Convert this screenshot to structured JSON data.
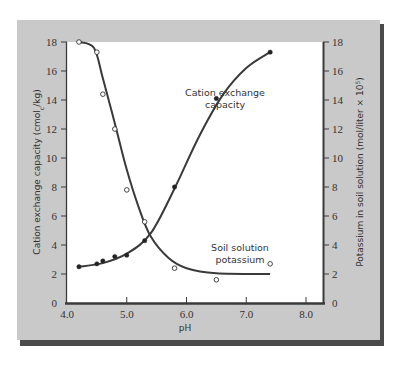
{
  "chart_data": {
    "type": "line",
    "title": "",
    "xlabel": "pH",
    "ylabel": "Cation exchange capacity (cmolc/kg)",
    "ylabel_right": "Potassium in soil solution (mol/liter × 10^5)",
    "xlim": [
      4.0,
      8.0
    ],
    "ylim": [
      0,
      18
    ],
    "ylim_right": [
      0,
      18
    ],
    "x_ticks": [
      "4.0",
      "5.0",
      "6.0",
      "7.0",
      "8.0"
    ],
    "y_ticks": [
      "0",
      "2",
      "4",
      "6",
      "8",
      "10",
      "12",
      "14",
      "16",
      "18"
    ],
    "y_ticks_right": [
      "0",
      "2",
      "4",
      "6",
      "8",
      "10",
      "12",
      "14",
      "16",
      "18"
    ],
    "grid": false,
    "legend": "none (curves labeled inline)",
    "series": [
      {
        "name": "Cation exchange capacity",
        "marker": "filled-circle",
        "axis": "left",
        "x": [
          4.2,
          4.5,
          4.6,
          4.8,
          5.0,
          5.3,
          5.8,
          6.5,
          7.4
        ],
        "y": [
          2.5,
          2.7,
          2.9,
          3.2,
          3.3,
          4.3,
          8.0,
          14.1,
          17.3
        ]
      },
      {
        "name": "Soil solution potassium",
        "marker": "open-circle",
        "axis": "right",
        "x": [
          4.2,
          4.5,
          4.6,
          4.8,
          5.0,
          5.3,
          5.8,
          6.5,
          7.4
        ],
        "y": [
          18.0,
          17.3,
          14.4,
          12.0,
          7.8,
          5.6,
          2.4,
          1.6,
          2.7
        ]
      }
    ],
    "annotations": [
      {
        "text": [
          "Cation exchange",
          "capacity"
        ],
        "x": 5.9,
        "y": 16.3
      },
      {
        "text": [
          "Soil solution",
          "potassium"
        ],
        "x": 6.6,
        "y": 3.4
      }
    ]
  },
  "labels": {
    "xlabel": "pH",
    "ylabel_left_main": "Cation exchange capacity (cmol",
    "ylabel_left_sub": "c",
    "ylabel_left_end": "/kg)",
    "ylabel_right_main": "Potassium in soil solution (mol/liter × 10",
    "ylabel_right_sup": "5",
    "ylabel_right_end": ")",
    "annot_cec_1": "Cation exchange",
    "annot_cec_2": "capacity",
    "annot_k_1": "Soil solution",
    "annot_k_2": "potassium"
  },
  "colors": {
    "panel": "#c9c9c9",
    "shadow": "#4a4a4a",
    "plot_bg": "#ffffff",
    "line": "#3a3a3a",
    "text": "#333333"
  }
}
